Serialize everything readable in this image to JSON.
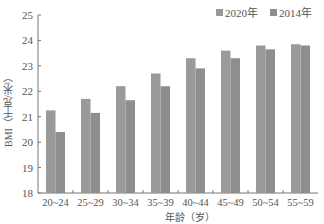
{
  "chart_data": {
    "type": "bar",
    "title": "",
    "xlabel": "年龄（岁）",
    "ylabel": "BMI（千克/米²）",
    "ylim": [
      18,
      25
    ],
    "yticks": [
      18,
      19,
      20,
      21,
      22,
      23,
      24,
      25
    ],
    "grid": false,
    "legend_position": "top-right",
    "categories": [
      "20~24",
      "25~29",
      "30~34",
      "35~39",
      "40~44",
      "45~49",
      "50~54",
      "55~59"
    ],
    "series": [
      {
        "name": "2020年",
        "color": "#9a9a9a",
        "values": [
          21.25,
          21.7,
          22.2,
          22.7,
          23.3,
          23.6,
          23.8,
          23.85
        ]
      },
      {
        "name": "2014年",
        "color": "#8e8e8e",
        "values": [
          20.4,
          21.15,
          21.65,
          22.2,
          22.9,
          23.3,
          23.65,
          23.8
        ]
      }
    ]
  },
  "legend": {
    "items": [
      {
        "label": "2020年",
        "color": "#9a9a9a"
      },
      {
        "label": "2014年",
        "color": "#8e8e8e"
      }
    ]
  },
  "axes": {
    "xlabel": "年龄（岁）",
    "ylabel": "BMI（千克/米²）"
  }
}
